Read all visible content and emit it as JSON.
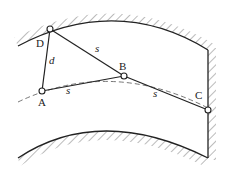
{
  "diagram": {
    "type": "tunnel-survey-geometry",
    "points": {
      "D": {
        "label": "D",
        "x": 50,
        "y": 29
      },
      "A": {
        "label": "A",
        "x": 42,
        "y": 91
      },
      "B": {
        "label": "B",
        "x": 124,
        "y": 76
      },
      "C": {
        "label": "C",
        "x": 208,
        "y": 110
      }
    },
    "segments": [
      {
        "from": "D",
        "to": "A",
        "label": "d"
      },
      {
        "from": "D",
        "to": "B",
        "label": "s"
      },
      {
        "from": "A",
        "to": "B",
        "label": "s"
      },
      {
        "from": "B",
        "to": "C",
        "label": "s"
      }
    ],
    "labels": {
      "D": "D",
      "A": "A",
      "B": "B",
      "C": "C",
      "d": "d",
      "s_DB": "s",
      "s_AB": "s",
      "s_BC": "s"
    },
    "colors": {
      "line": "#222222",
      "hatch": "#444444",
      "dashed": "#555555",
      "background": "#ffffff"
    }
  }
}
